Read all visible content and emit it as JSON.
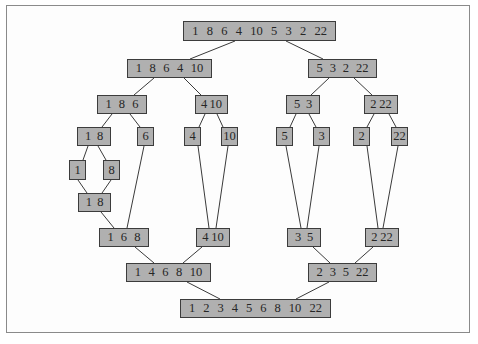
{
  "diagram": {
    "title": "",
    "type": "merge-sort-tree",
    "colors": {
      "node_fill": "#b0b0b0",
      "node_border": "#3c3c3c",
      "edge": "#3a3a3a",
      "frame": "#8a8a8a"
    },
    "nodes": {
      "root": {
        "values": [
          "1",
          "8",
          "6",
          "4",
          "10",
          "5",
          "3",
          "2",
          "22"
        ]
      },
      "d1_l": {
        "values": [
          "1",
          "8",
          "6",
          "4",
          "10"
        ]
      },
      "d1_r": {
        "values": [
          "5",
          "3",
          "2",
          "22"
        ]
      },
      "d2_ll": {
        "values": [
          "1",
          "8",
          "6"
        ]
      },
      "d2_lr": {
        "values": [
          "4",
          "10"
        ]
      },
      "d2_rl": {
        "values": [
          "5",
          "3"
        ]
      },
      "d2_rr": {
        "values": [
          "2",
          "22"
        ]
      },
      "d3_a": {
        "values": [
          "1",
          "8"
        ]
      },
      "d3_b": {
        "values": [
          "6"
        ]
      },
      "d3_c": {
        "values": [
          "4"
        ]
      },
      "d3_d": {
        "values": [
          "10"
        ]
      },
      "d3_e": {
        "values": [
          "5"
        ]
      },
      "d3_f": {
        "values": [
          "3"
        ]
      },
      "d3_g": {
        "values": [
          "2"
        ]
      },
      "d3_h": {
        "values": [
          "22"
        ]
      },
      "d4_a": {
        "values": [
          "1"
        ]
      },
      "d4_b": {
        "values": [
          "8"
        ]
      },
      "m4_a": {
        "values": [
          "1",
          "8"
        ]
      },
      "m3_a": {
        "values": [
          "1",
          "6",
          "8"
        ]
      },
      "m3_b": {
        "values": [
          "4",
          "10"
        ]
      },
      "m3_c": {
        "values": [
          "3",
          "5"
        ]
      },
      "m3_d": {
        "values": [
          "2",
          "22"
        ]
      },
      "m2_l": {
        "values": [
          "1",
          "4",
          "6",
          "8",
          "10"
        ]
      },
      "m2_r": {
        "values": [
          "2",
          "3",
          "5",
          "22"
        ]
      },
      "final": {
        "values": [
          "1",
          "2",
          "3",
          "4",
          "5",
          "6",
          "8",
          "10",
          "22"
        ]
      }
    }
  }
}
